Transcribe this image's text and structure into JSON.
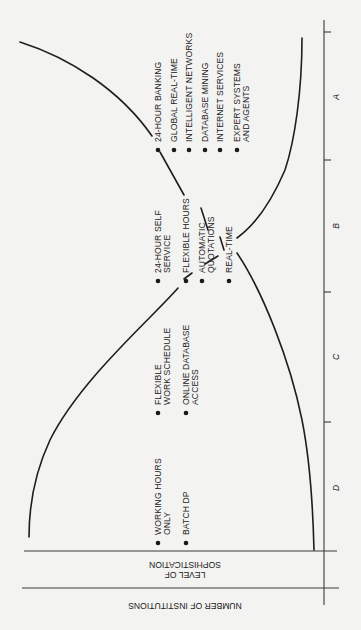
{
  "figure": {
    "orientation": "rotated 90 degrees (landscape figure on portrait page)",
    "axis_titles": {
      "level": "LEVEL OF\nSOPHISTICATION",
      "level_line1": "LEVEL OF",
      "level_line2": "SOPHISTICATION",
      "number": "NUMBER OF INSTITUTIONS"
    },
    "stages": [
      {
        "label": "A",
        "tick_y": 32,
        "label_y": 97
      },
      {
        "label": "B",
        "tick_y": 160,
        "label_y": 226
      },
      {
        "label": "C",
        "tick_y": 292,
        "label_y": 357
      },
      {
        "label": "D",
        "tick_y": 422,
        "label_y": 488
      }
    ],
    "stage_groups": [
      {
        "stage": "A",
        "bullet_y": 150,
        "items": [
          {
            "lines": [
              "24-HOUR BANKING"
            ],
            "x": 158
          },
          {
            "lines": [
              "GLOBAL REAL-TIME"
            ],
            "x": 174
          },
          {
            "lines": [
              "INTELLIGENT NETWORKS"
            ],
            "x": 189
          },
          {
            "lines": [
              "DATABASE MINING"
            ],
            "x": 205
          },
          {
            "lines": [
              "INTERNET SERVICES"
            ],
            "x": 220
          },
          {
            "lines": [
              "EXPERT SYSTEMS",
              "AND AGENTS"
            ],
            "x": 237
          }
        ]
      },
      {
        "stage": "B",
        "bullet_y": 281,
        "items": [
          {
            "lines": [
              "24-HOUR SELF",
              "SERVICE"
            ],
            "x": 158
          },
          {
            "lines": [
              "FLEXIBLE HOURS"
            ],
            "x": 186
          },
          {
            "lines": [
              "AUTOMATIC",
              "QUOTATIONS"
            ],
            "x": 202
          },
          {
            "lines": [
              "REAL-TIME"
            ],
            "x": 229
          }
        ]
      },
      {
        "stage": "C",
        "bullet_y": 413,
        "items": [
          {
            "lines": [
              "FLEXIBLE",
              "WORK SCHEDULE"
            ],
            "x": 158
          },
          {
            "lines": [
              "ONLINE DATABASE",
              "ACCESS"
            ],
            "x": 186
          }
        ]
      },
      {
        "stage": "D",
        "bullet_y": 543,
        "items": [
          {
            "lines": [
              "WORKING HOURS",
              "ONLY"
            ],
            "x": 158
          },
          {
            "lines": [
              "BATCH DP"
            ],
            "x": 186
          }
        ]
      }
    ],
    "curves": {
      "sophistication": {
        "name": "Level of sophistication",
        "segments": [
          "M20,42 C70,58 120,90 152,136",
          "M160,152 L184,195",
          "M201,208 L208,230",
          "M220,237 L224,250",
          "M218,256 L205,264",
          "M192,273 L184,279",
          "M178,288 C150,320 80,380 50,440 C36,470 29,505 29,537"
        ]
      },
      "institutions": {
        "name": "Number of institutions",
        "segments": [
          "M302,38 C302,90 295,140 285,170 C270,205 255,225 237,238",
          "M237,253 C262,290 290,360 302,420 C310,460 313,510 314,550"
        ]
      }
    },
    "colors": {
      "background": "#f3f3f1",
      "ink": "#1e1e1e"
    }
  }
}
